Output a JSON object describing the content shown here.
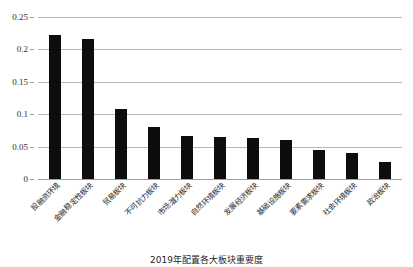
{
  "chart_data": {
    "type": "bar",
    "title": "",
    "caption": "2019年配置各大板块重要度",
    "xlabel": "",
    "ylabel": "",
    "ylim": [
      0,
      0.25
    ],
    "ytick_labels": [
      "0",
      "0.05",
      "0.1",
      "0.15",
      "0.2",
      "0.25"
    ],
    "ytick_values": [
      0,
      0.05,
      0.1,
      0.15,
      0.2,
      0.25
    ],
    "grid": true,
    "legend": "none",
    "bar_color": "#0d0d0d",
    "gridline_color": "#b7b7b7",
    "categories": [
      "投融资环境",
      "金融稳定性板块",
      "贸易板块",
      "不可抗力板块",
      "市场潜力板块",
      "自然环境板块",
      "发展经济板块",
      "基础设施板块",
      "要素需求板块",
      "社会环境板块",
      "政治板块"
    ],
    "values": [
      0.223,
      0.216,
      0.108,
      0.08,
      0.066,
      0.065,
      0.063,
      0.06,
      0.045,
      0.04,
      0.026
    ]
  }
}
